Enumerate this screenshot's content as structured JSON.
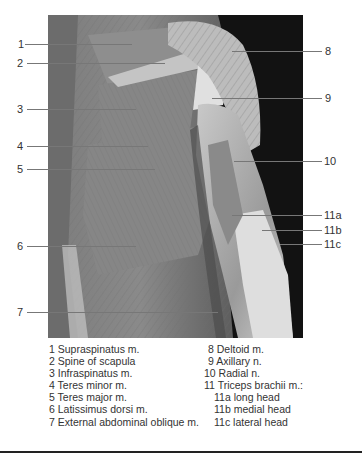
{
  "figure": {
    "photo": {
      "description": "Posterior view dissection of shoulder, back and upper arm",
      "colors": {
        "background_dark": "#111111",
        "muscle_mid": "#7a7a7a",
        "tendon_light": "#d8d8d8"
      }
    },
    "left_labels": [
      {
        "id": "1",
        "text": "1",
        "y": 44,
        "line_end_x": 132
      },
      {
        "id": "2",
        "text": "2",
        "y": 63,
        "line_end_x": 165
      },
      {
        "id": "3",
        "text": "3",
        "y": 109,
        "line_end_x": 136
      },
      {
        "id": "4",
        "text": "4",
        "y": 146,
        "line_end_x": 148
      },
      {
        "id": "5",
        "text": "5",
        "y": 169,
        "line_end_x": 155
      },
      {
        "id": "6",
        "text": "6",
        "y": 246,
        "line_end_x": 136
      },
      {
        "id": "7",
        "text": "7",
        "y": 312,
        "line_end_x": 218
      }
    ],
    "right_labels": [
      {
        "id": "8",
        "text": "8",
        "y": 51,
        "line_start_x": 232
      },
      {
        "id": "9",
        "text": "9",
        "y": 98,
        "line_start_x": 212
      },
      {
        "id": "10",
        "text": "10",
        "y": 161,
        "line_start_x": 234
      },
      {
        "id": "11a",
        "text": "11a",
        "y": 215,
        "line_start_x": 232
      },
      {
        "id": "11b",
        "text": "11b",
        "y": 230,
        "line_start_x": 262
      },
      {
        "id": "11c",
        "text": "11c",
        "y": 244,
        "line_start_x": 280
      }
    ]
  },
  "legend": {
    "column1": [
      "1 Supraspinatus m.",
      "2 Spine of scapula",
      "3 Infraspinatus m.",
      "4 Teres minor m.",
      "5 Teres major m.",
      "6 Latissimus dorsi m.",
      "7 External abdominal oblique m."
    ],
    "column2": [
      "8 Deltoid m.",
      "9 Axillary n.",
      "10 Radial n.",
      "11 Triceps brachii m.:",
      "11a long head",
      "11b medial head",
      "11c lateral head"
    ]
  }
}
